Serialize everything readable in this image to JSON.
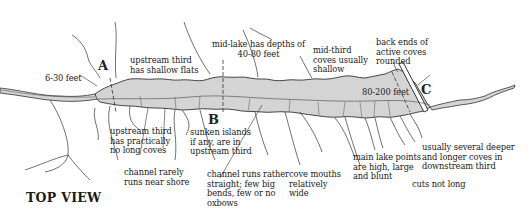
{
  "diagram": {
    "title": "TOP VIEW",
    "colors": {
      "background": "#ffffff",
      "lake_fill": "#d4d4d4",
      "line": "#333333",
      "text": "#222222"
    },
    "markers": [
      {
        "id": "A",
        "label": "A"
      },
      {
        "id": "B",
        "label": "B"
      },
      {
        "id": "C",
        "label": "C"
      }
    ],
    "depth_labels": {
      "upstream": "6-30 feet",
      "mid_lake": "mid-lake has depths of\n40-80 feet",
      "downstream": "80-200 feet"
    },
    "annotations": {
      "upstream_flats": "upstream third\nhas shallow flats",
      "mid_third_coves": "mid-third\ncoves usually\nshallow",
      "back_ends": "back ends of\nactive coves\nrounded",
      "no_long_coves": "upstream third\nhas practically\nno long coves",
      "channel_rarely": "channel rarely\nruns near shore",
      "sunken_islands": "sunken islands\nif any, are in\nupstream third",
      "channel_straight": "channel runs rather\nstraight; few big\nbends, few or no\noxbows",
      "cove_mouths": "cove mouths\nrelatively\nwide",
      "main_points": "main lake points\nare high, large\nand blunt",
      "cuts": "cuts not long",
      "deeper_coves": "usually several deeper\nand longer coves in\ndownstream third"
    }
  }
}
